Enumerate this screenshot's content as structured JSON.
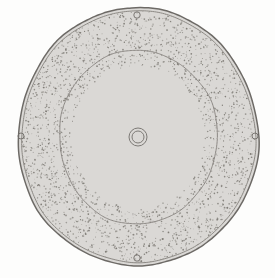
{
  "figure": {
    "title": "Sectional plan view of annular disc",
    "type": "technical-line-drawing",
    "medium": "scanned ink drawing",
    "width": 275,
    "height": 278,
    "background_color": "#fdfdfc",
    "ink_color": "#6d6a66",
    "stipple_color": "#7a7771",
    "labels": []
  },
  "geometry": {
    "center": {
      "x": 138,
      "y": 137
    },
    "outer_rim": {
      "name": "outer-rim",
      "description": "irregular hand-drawn outer boundary, double line with shaded band",
      "radius_x": 120,
      "radius_y": 129,
      "line_count": 2
    },
    "stipple_annulus": {
      "name": "stippled-annulus",
      "description": "dense stipple texture between outer rim and inner circle",
      "outer_radius_x": 117,
      "outer_radius_y": 126,
      "inner_radius_x": 79,
      "inner_radius_y": 87,
      "dot_count": 2600
    },
    "inner_circle": {
      "name": "inner-circle",
      "description": "thin single-line inner boundary enclosing blank field",
      "radius_x": 79,
      "radius_y": 87
    },
    "center_hub": {
      "name": "center-hub",
      "description": "small concentric double ring at center",
      "outer_radius": 9,
      "inner_radius": 6
    },
    "peripheral_holes": [
      {
        "name": "hole-top",
        "x": 137,
        "y": 15,
        "radius": 3.2
      },
      {
        "name": "hole-left",
        "x": 21,
        "y": 136,
        "radius": 3.0
      },
      {
        "name": "hole-right",
        "x": 255,
        "y": 136,
        "radius": 3.0
      },
      {
        "name": "hole-bottom",
        "x": 137,
        "y": 258,
        "radius": 3.2
      }
    ]
  }
}
